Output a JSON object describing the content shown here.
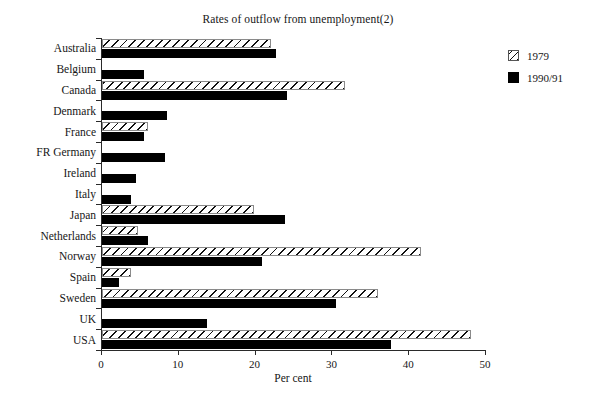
{
  "chart_data": {
    "type": "bar",
    "orientation": "horizontal",
    "title": "Rates of outflow from unemployment(2)",
    "xlabel": "Per cent",
    "ylabel": "",
    "xlim": [
      0,
      50
    ],
    "xticks": [
      0,
      10,
      20,
      30,
      40,
      50
    ],
    "xtick_labels": [
      "0",
      "10",
      "20",
      "30",
      "40",
      "50"
    ],
    "grid": false,
    "legend_position": "right",
    "categories": [
      "Australia",
      "Belgium",
      "Canada",
      "Denmark",
      "France",
      "FR Germany",
      "Ireland",
      "Italy",
      "Japan",
      "Netherlands",
      "Norway",
      "Spain",
      "Sweden",
      "UK",
      "USA"
    ],
    "series": [
      {
        "name": "1979",
        "style": "hatched",
        "color": "#ffffff",
        "values": [
          22.0,
          0,
          31.6,
          0,
          6.0,
          0,
          0,
          0,
          19.8,
          4.7,
          41.5,
          3.8,
          35.9,
          0,
          48.0
        ]
      },
      {
        "name": "1990/91",
        "style": "solid",
        "color": "#000000",
        "values": [
          22.7,
          5.5,
          24.1,
          8.5,
          5.5,
          8.2,
          4.4,
          3.8,
          23.8,
          6.0,
          20.8,
          2.2,
          30.5,
          13.7,
          37.6
        ]
      }
    ]
  },
  "legend": {
    "items": [
      {
        "label": "1979",
        "swatch": "hatched-swatch-icon"
      },
      {
        "label": "1990/91",
        "swatch": "solid-swatch-icon"
      }
    ]
  }
}
